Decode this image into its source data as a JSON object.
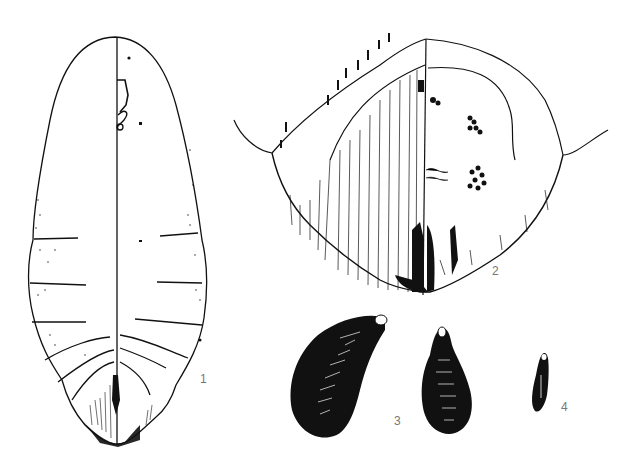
{
  "plate": {
    "figures": [
      {
        "id": "fig1",
        "label": "1",
        "description": "Elongate oval larva, dorsal/ventral split view with segment lines"
      },
      {
        "id": "fig2",
        "label": "2",
        "description": "Head/posterior region, bisected view with setae and hatching"
      },
      {
        "id": "fig3",
        "label": "3",
        "description": "Two dark tapered eggs/cocoons, large curved and medium pear-shaped"
      },
      {
        "id": "fig4",
        "label": "4",
        "description": "Small slender dark elongate body"
      }
    ],
    "colors": {
      "ink": "#111111",
      "paper": "#ffffff",
      "label": "#777777"
    }
  }
}
